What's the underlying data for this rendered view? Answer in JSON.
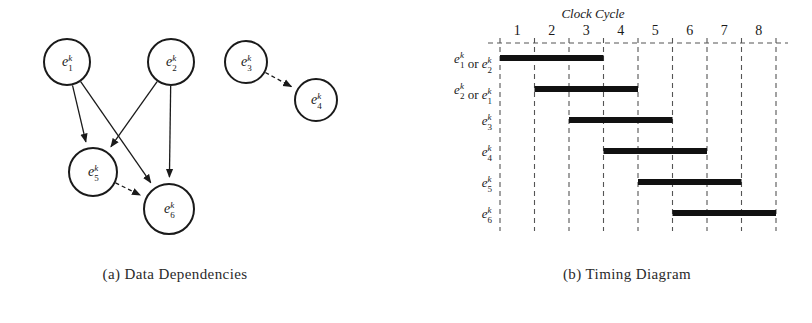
{
  "figure": {
    "panel_a": {
      "caption": "(a) Data Dependencies",
      "nodes": [
        {
          "id": "e1",
          "base": "e",
          "sub": "1",
          "sup": "k",
          "cx": 67,
          "cy": 62,
          "r": 23
        },
        {
          "id": "e2",
          "base": "e",
          "sub": "2",
          "sup": "k",
          "cx": 171,
          "cy": 62,
          "r": 23
        },
        {
          "id": "e3",
          "base": "e",
          "sub": "3",
          "sup": "k",
          "cx": 246,
          "cy": 62,
          "r": 21
        },
        {
          "id": "e4",
          "base": "e",
          "sub": "4",
          "sup": "k",
          "cx": 316,
          "cy": 100,
          "r": 21
        },
        {
          "id": "e5",
          "base": "e",
          "sub": "5",
          "sup": "k",
          "cx": 93,
          "cy": 172,
          "r": 24
        },
        {
          "id": "e6",
          "base": "e",
          "sub": "6",
          "sup": "k",
          "cx": 169,
          "cy": 209,
          "r": 25
        }
      ],
      "edges": [
        {
          "from": "e1",
          "to": "e5",
          "style": "solid"
        },
        {
          "from": "e1",
          "to": "e6",
          "style": "solid"
        },
        {
          "from": "e2",
          "to": "e5",
          "style": "solid"
        },
        {
          "from": "e2",
          "to": "e6",
          "style": "solid"
        },
        {
          "from": "e5",
          "to": "e6",
          "style": "dashed"
        },
        {
          "from": "e3",
          "to": "e4",
          "style": "dashed"
        }
      ]
    },
    "panel_b": {
      "caption": "(b) Timing Diagram",
      "axis_title": "Clock Cycle",
      "cycles": [
        "1",
        "2",
        "3",
        "4",
        "5",
        "6",
        "7",
        "8"
      ],
      "rows": [
        {
          "label_html": "e₁ᵏ or e₂ᵏ",
          "parts": [
            {
              "base": "e",
              "sub": "1",
              "sup": "k"
            },
            {
              "text": " or "
            },
            {
              "base": "e",
              "sub": "2",
              "sup": "k"
            }
          ],
          "start": 1,
          "end": 3
        },
        {
          "label_html": "e₂ᵏ or e₁ᵏ",
          "parts": [
            {
              "base": "e",
              "sub": "2",
              "sup": "k"
            },
            {
              "text": " or "
            },
            {
              "base": "e",
              "sub": "1",
              "sup": "k"
            }
          ],
          "start": 2,
          "end": 4
        },
        {
          "label_html": "e₃ᵏ",
          "parts": [
            {
              "base": "e",
              "sub": "3",
              "sup": "k"
            }
          ],
          "start": 3,
          "end": 5
        },
        {
          "label_html": "e₄ᵏ",
          "parts": [
            {
              "base": "e",
              "sub": "4",
              "sup": "k"
            }
          ],
          "start": 4,
          "end": 6
        },
        {
          "label_html": "e₅ᵏ",
          "parts": [
            {
              "base": "e",
              "sub": "5",
              "sup": "k"
            }
          ],
          "start": 5,
          "end": 7
        },
        {
          "label_html": "e₆ᵏ",
          "parts": [
            {
              "base": "e",
              "sub": "6",
              "sup": "k"
            }
          ],
          "start": 6,
          "end": 8
        }
      ]
    }
  },
  "chart_data": {
    "type": "bar",
    "title": "Clock Cycle",
    "xlabel": "Clock Cycle",
    "ylabel": "",
    "categories": [
      "e1k or e2k",
      "e2k or e1k",
      "e3k",
      "e4k",
      "e5k",
      "e6k"
    ],
    "series": [
      {
        "name": "start_cycle",
        "values": [
          1,
          2,
          3,
          4,
          5,
          6
        ]
      },
      {
        "name": "end_cycle",
        "values": [
          3,
          4,
          5,
          6,
          7,
          8
        ]
      },
      {
        "name": "duration",
        "values": [
          3,
          3,
          3,
          3,
          3,
          3
        ]
      }
    ],
    "xlim": [
      0,
      8
    ],
    "xticks": [
      "1",
      "2",
      "3",
      "4",
      "5",
      "6",
      "7",
      "8"
    ],
    "grid": true,
    "legend": "none"
  },
  "colors": {
    "ink": "#1a1a1a",
    "grid": "#555555",
    "bar": "#111111",
    "background": "#ffffff"
  }
}
